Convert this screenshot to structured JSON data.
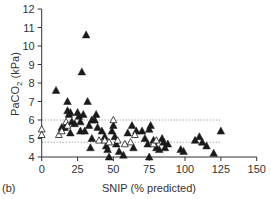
{
  "panel_label": "(b)",
  "chart_data": {
    "type": "scatter",
    "title": "",
    "xlabel": "SNIP (% predicted)",
    "ylabel": "PaCO2 (kPa)",
    "ylabel_main": "PaCO",
    "ylabel_sub": "2",
    "ylabel_unit": " (kPa)",
    "xlim": [
      0,
      150
    ],
    "ylim": [
      4,
      12
    ],
    "xticks": [
      0,
      25,
      50,
      75,
      100,
      125,
      150
    ],
    "yticks": [
      4,
      5,
      6,
      7,
      8,
      9,
      10,
      11,
      12
    ],
    "grid": false,
    "reference_lines": [
      {
        "y": 6.0,
        "style": "dotted",
        "x_range": [
          0,
          125
        ]
      },
      {
        "y": 4.8,
        "style": "dotted",
        "x_range": [
          0,
          125
        ]
      }
    ],
    "series": [
      {
        "name": "filled triangles",
        "marker": "filled-triangle",
        "color": "#1a1a1a",
        "points": [
          [
            10,
            7.6
          ],
          [
            14,
            5.6
          ],
          [
            16,
            5.6
          ],
          [
            18,
            7.0
          ],
          [
            18,
            6.5
          ],
          [
            19,
            6.3
          ],
          [
            20,
            6.4
          ],
          [
            20,
            5.3
          ],
          [
            21,
            5.9
          ],
          [
            23,
            5.8
          ],
          [
            25,
            6.4
          ],
          [
            26,
            6.2
          ],
          [
            27,
            5.9
          ],
          [
            27,
            5.4
          ],
          [
            28,
            8.6
          ],
          [
            29,
            6.3
          ],
          [
            30,
            5.4
          ],
          [
            31,
            10.6
          ],
          [
            32,
            7.0
          ],
          [
            33,
            5.7
          ],
          [
            34,
            4.5
          ],
          [
            35,
            6.0
          ],
          [
            35,
            5.0
          ],
          [
            37,
            6.0
          ],
          [
            38,
            6.3
          ],
          [
            39,
            5.6
          ],
          [
            42,
            5.4
          ],
          [
            44,
            5.1
          ],
          [
            45,
            4.6
          ],
          [
            46,
            4.4
          ],
          [
            47,
            4.0
          ],
          [
            49,
            5.4
          ],
          [
            50,
            5.7
          ],
          [
            51,
            5.1
          ],
          [
            52,
            4.7
          ],
          [
            54,
            4.3
          ],
          [
            57,
            4.1
          ],
          [
            60,
            5.3
          ],
          [
            63,
            5.7
          ],
          [
            64,
            4.5
          ],
          [
            66,
            5.4
          ],
          [
            70,
            5.4
          ],
          [
            72,
            5.0
          ],
          [
            74,
            4.7
          ],
          [
            75,
            4.0
          ],
          [
            75,
            5.5
          ],
          [
            76,
            5.7
          ],
          [
            78,
            4.9
          ],
          [
            80,
            4.5
          ],
          [
            82,
            4.4
          ],
          [
            84,
            5.0
          ],
          [
            85,
            4.8
          ],
          [
            86,
            4.5
          ],
          [
            88,
            4.7
          ],
          [
            97,
            4.4
          ],
          [
            99,
            4.3
          ],
          [
            107,
            4.9
          ],
          [
            110,
            5.1
          ],
          [
            112,
            4.8
          ],
          [
            115,
            4.6
          ],
          [
            120,
            4.2
          ],
          [
            125,
            5.4
          ]
        ]
      },
      {
        "name": "open triangles",
        "marker": "open-triangle",
        "color": "#1a1a1a",
        "points": [
          [
            0,
            5.5
          ],
          [
            0,
            5.2
          ],
          [
            12,
            5.2
          ],
          [
            14,
            5.4
          ],
          [
            17,
            5.9
          ],
          [
            18,
            5.7
          ],
          [
            40,
            4.9
          ],
          [
            44,
            4.9
          ],
          [
            47,
            4.8
          ],
          [
            50,
            6.0
          ],
          [
            53,
            4.9
          ],
          [
            58,
            4.7
          ],
          [
            62,
            4.8
          ],
          [
            65,
            5.2
          ],
          [
            78,
            4.7
          ],
          [
            80,
            4.9
          ]
        ]
      }
    ]
  }
}
